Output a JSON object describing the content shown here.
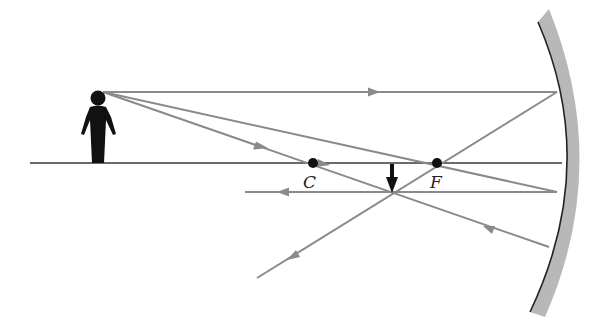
{
  "diagram": {
    "labels": {
      "center": "C",
      "focus": "F"
    },
    "colors": {
      "ray": "#8a8a8a",
      "axis": "#3a3a3a",
      "mirror_fill": "#b8b8b8",
      "mirror_edge": "#222222",
      "object": "#111111",
      "points": "#111111"
    },
    "elements": {
      "object": "person silhouette (upright)",
      "image": "small inverted arrow between C and F",
      "mirror": "concave spherical mirror on right",
      "rays": [
        "parallel ray reflects through F",
        "ray through F reflects parallel",
        "ray through C reflects back on itself"
      ]
    }
  }
}
